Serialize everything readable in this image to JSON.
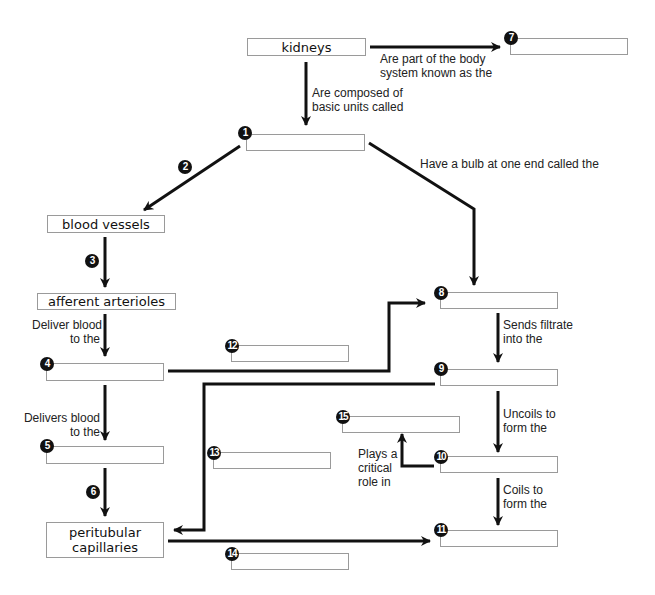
{
  "diagram": {
    "type": "concept-map",
    "topic": "kidneys",
    "nodes": {
      "kidneys": "kidneys",
      "blood_vessels": "blood vessels",
      "afferent_arterioles": "afferent arterioles",
      "peritubular_capillaries": "peritubular\ncapillaries"
    },
    "blanks": {
      "b1": {
        "number": "1",
        "value": ""
      },
      "b4": {
        "number": "4",
        "value": ""
      },
      "b5": {
        "number": "5",
        "value": ""
      },
      "b7": {
        "number": "7",
        "value": ""
      },
      "b8": {
        "number": "8",
        "value": ""
      },
      "b9": {
        "number": "9",
        "value": ""
      },
      "b10": {
        "number": "10",
        "value": ""
      },
      "b11": {
        "number": "11",
        "value": ""
      },
      "b12": {
        "number": "12",
        "value": ""
      },
      "b13": {
        "number": "13",
        "value": ""
      },
      "b14": {
        "number": "14",
        "value": ""
      },
      "b15": {
        "number": "15",
        "value": ""
      }
    },
    "link_numbers": {
      "n2": "2",
      "n3": "3",
      "n6": "6"
    },
    "link_labels": {
      "body_system": "Are part of the body\nsystem known as the",
      "composed_of": "Are composed of\nbasic units called",
      "bulb": "Have a bulb at one end called the",
      "deliver_blood": "Deliver blood\nto the",
      "delivers_blood": "Delivers blood\nto the",
      "sends_filtrate": "Sends filtrate\ninto the",
      "uncoils": "Uncoils to\nform the",
      "critical_role": "Plays a\ncritical\nrole in",
      "coils": "Coils to\nform the"
    }
  }
}
